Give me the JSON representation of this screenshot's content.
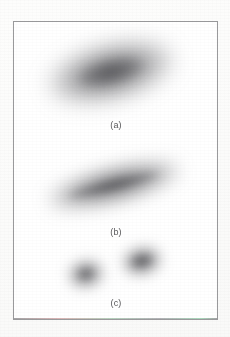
{
  "figure": {
    "background_color": "#fdfdfc",
    "plate_background_color": "#ffffff",
    "frame_color": "#9a9a9c",
    "spot_color": "#4a4a4e",
    "label_color": "#58585a",
    "frame": {
      "x": 13,
      "y": 21,
      "width": 205,
      "height": 299
    }
  },
  "panels": [
    {
      "id": "panel-a",
      "label": "(a)",
      "label_x": 95,
      "label_y": 119,
      "spots": [
        {
          "name": "spot-a-main",
          "cx": 110,
          "cy": 71,
          "rx": 64,
          "ry": 27,
          "rotation": -14,
          "opacity": 0.8,
          "blur": 11,
          "core_opacity": 0.52,
          "core_rx": 33,
          "core_ry": 11,
          "core_blur": 6
        }
      ]
    },
    {
      "id": "panel-b",
      "label": "(b)",
      "label_x": 95,
      "label_y": 226,
      "spots": [
        {
          "name": "spot-b-main",
          "cx": 113,
          "cy": 184,
          "rx": 68,
          "ry": 17,
          "rotation": -14,
          "opacity": 0.82,
          "blur": 9,
          "core_opacity": 0.58,
          "core_rx": 47,
          "core_ry": 5,
          "core_blur": 4
        }
      ]
    },
    {
      "id": "panel-c",
      "label": "(c)",
      "label_x": 95,
      "label_y": 297,
      "spots": [
        {
          "name": "spot-c-left",
          "cx": 85,
          "cy": 273,
          "rx": 18,
          "ry": 14,
          "rotation": -12,
          "opacity": 0.78,
          "blur": 7,
          "core_opacity": 0.5,
          "core_rx": 8,
          "core_ry": 5,
          "core_blur": 4
        },
        {
          "name": "spot-c-right",
          "cx": 141,
          "cy": 260,
          "rx": 20,
          "ry": 14,
          "rotation": -12,
          "opacity": 0.82,
          "blur": 7,
          "core_opacity": 0.56,
          "core_rx": 11,
          "core_ry": 5,
          "core_blur": 4
        }
      ]
    }
  ],
  "chart_data": {
    "type": "scatter",
    "title": "",
    "xlabel": "",
    "ylabel": "",
    "xlim": [
      0,
      205
    ],
    "ylim": [
      0,
      299
    ],
    "grid": false,
    "legend": "none",
    "series": [
      {
        "name": "(a)",
        "points": [
          {
            "x": 110,
            "y": 71,
            "major_axis": 128,
            "minor_axis": 54,
            "angle_deg": -14,
            "intensity": 0.8
          }
        ]
      },
      {
        "name": "(b)",
        "points": [
          {
            "x": 113,
            "y": 184,
            "major_axis": 136,
            "minor_axis": 34,
            "angle_deg": -14,
            "intensity": 0.82
          }
        ]
      },
      {
        "name": "(c)",
        "points": [
          {
            "x": 85,
            "y": 273,
            "major_axis": 36,
            "minor_axis": 28,
            "angle_deg": -12,
            "intensity": 0.78
          },
          {
            "x": 141,
            "y": 260,
            "major_axis": 40,
            "minor_axis": 28,
            "angle_deg": -12,
            "intensity": 0.82
          }
        ]
      }
    ],
    "tick_labels": {
      "x": [],
      "y": []
    },
    "annotations": [
      {
        "text": "(a)",
        "x": 115,
        "y": 119
      },
      {
        "text": "(b)",
        "x": 115,
        "y": 226
      },
      {
        "text": "(c)",
        "x": 115,
        "y": 297
      }
    ]
  }
}
